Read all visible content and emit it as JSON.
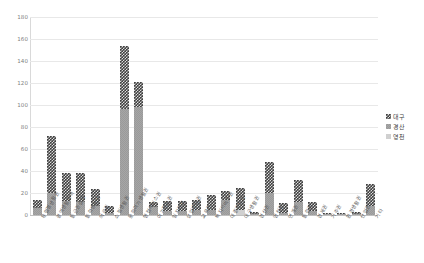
{
  "chart_data": {
    "type": "bar",
    "stacked": true,
    "title": "",
    "subtitle": "",
    "xlabel": "",
    "ylabel": "",
    "ylim": [
      0,
      180
    ],
    "ytick_step": 20,
    "yticks": [
      0,
      20,
      40,
      60,
      80,
      100,
      120,
      140,
      160,
      180
    ],
    "grid": true,
    "legend_position": "right",
    "legend": [
      "대구",
      "경산",
      "영천"
    ],
    "categories": [
      "유형별생활권",
      "광역생활권역",
      "통근권설정",
      "통학생활권",
      "의료권",
      "쇼핑생활권",
      "문화여가생활권",
      "행정서비스권",
      "여가활동권",
      "일자리권",
      "상업생활권",
      "교육권",
      "복지서비스권",
      "대중교통권",
      "대구생활권",
      "경산권",
      "영천권",
      "연계권",
      "통합권",
      "경제권",
      "거주권",
      "환경생활권",
      "산업권",
      "기타"
    ],
    "series": [
      {
        "name": "대구",
        "values": [
          8,
          52,
          25,
          26,
          16,
          6,
          58,
          23,
          5,
          9,
          9,
          9,
          13,
          8,
          20,
          2,
          28,
          9,
          20,
          8,
          1,
          1,
          2,
          20
        ]
      },
      {
        "name": "경산",
        "values": [
          6,
          20,
          13,
          12,
          8,
          2,
          96,
          98,
          7,
          4,
          4,
          5,
          5,
          14,
          0,
          1,
          20,
          2,
          12,
          4,
          1,
          1,
          1,
          8
        ]
      },
      {
        "name": "영천",
        "values": [
          0,
          0,
          0,
          0,
          0,
          0,
          0,
          0,
          0,
          0,
          0,
          0,
          0,
          0,
          5,
          0,
          0,
          0,
          0,
          0,
          0,
          0,
          0,
          0
        ]
      }
    ],
    "totals": [
      14,
      72,
      38,
      38,
      24,
      8,
      154,
      121,
      12,
      13,
      13,
      14,
      18,
      22,
      25,
      3,
      48,
      11,
      32,
      12,
      2,
      2,
      3,
      28
    ],
    "colors": {
      "series_0": "#3f3f3f",
      "series_1": "#a6a6a6",
      "series_2": "#d0d0d0",
      "grid": "#e8e8e8",
      "axis": "#bfbfbf",
      "tick_text": "#808080",
      "label_text": "#5a5a5a",
      "background": "#ffffff"
    }
  }
}
